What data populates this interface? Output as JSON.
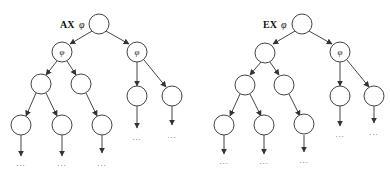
{
  "diagrams": [
    {
      "title_op": "AX",
      "title_formula": "φ",
      "node_label": "φ",
      "continuation": "..."
    },
    {
      "title_op": "EX",
      "title_formula": "φ",
      "node_label": "φ",
      "continuation": "..."
    }
  ]
}
